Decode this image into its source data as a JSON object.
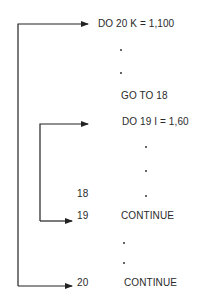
{
  "diagram": {
    "outer_loop": {
      "do_statement": "DO 20 K = 1,100",
      "goto_statement": "GO TO 18",
      "end_label": "20",
      "end_statement": "CONTINUE"
    },
    "inner_loop": {
      "do_statement": "DO 19 I = 1,60",
      "label_18": "18",
      "end_label": "19",
      "end_statement": "CONTINUE"
    },
    "ellipsis_dot": "•",
    "colors": {
      "line": "#222222",
      "text": "#2a2a2a",
      "background": "#ffffff"
    }
  }
}
